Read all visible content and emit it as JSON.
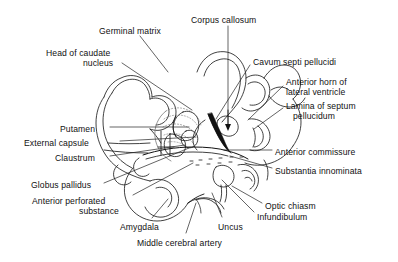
{
  "figure": {
    "type": "anatomical-line-drawing",
    "background_color": "#ffffff",
    "ink_color": "#111111",
    "leader_line_color": "#222222"
  },
  "labels": [
    {
      "id": "germinal-matrix",
      "text": "Germinal matrix",
      "x": 99,
      "y": 26,
      "align": "left"
    },
    {
      "id": "corpus-callosum",
      "text": "Corpus callosum",
      "x": 191,
      "y": 15,
      "align": "left"
    },
    {
      "id": "head-of-caudate-nucleus-1",
      "text": "Head of caudate",
      "x": 46,
      "y": 48,
      "align": "left"
    },
    {
      "id": "head-of-caudate-nucleus-2",
      "text": "nucleus",
      "x": 83,
      "y": 58,
      "align": "left"
    },
    {
      "id": "cavum-septi-pellucidi",
      "text": "Cavum septi pellucidi",
      "x": 253,
      "y": 57,
      "align": "left"
    },
    {
      "id": "anterior-horn-1",
      "text": "Anterior horn of",
      "x": 286,
      "y": 77,
      "align": "left"
    },
    {
      "id": "anterior-horn-2",
      "text": "lateral ventricle",
      "x": 286,
      "y": 87,
      "align": "left"
    },
    {
      "id": "lamina-septum-1",
      "text": "Lamina of septum",
      "x": 286,
      "y": 101,
      "align": "left"
    },
    {
      "id": "lamina-septum-2",
      "text": "pellucidum",
      "x": 293,
      "y": 111,
      "align": "left"
    },
    {
      "id": "putamen",
      "text": "Putamen",
      "x": 60,
      "y": 124,
      "align": "left"
    },
    {
      "id": "external-capsule",
      "text": "External capsule",
      "x": 24,
      "y": 138,
      "align": "left"
    },
    {
      "id": "claustrum",
      "text": "Claustrum",
      "x": 55,
      "y": 153,
      "align": "left"
    },
    {
      "id": "anterior-commissure",
      "text": "Anterior commissure",
      "x": 275,
      "y": 147,
      "align": "left"
    },
    {
      "id": "substantia-innominata",
      "text": "Substantia innominata",
      "x": 275,
      "y": 166,
      "align": "left"
    },
    {
      "id": "globus-pallidus",
      "text": "Globus pallidus",
      "x": 31,
      "y": 180,
      "align": "left"
    },
    {
      "id": "anterior-perforated-1",
      "text": "Anterior perforated",
      "x": 32,
      "y": 196,
      "align": "left"
    },
    {
      "id": "anterior-perforated-2",
      "text": "substance",
      "x": 79,
      "y": 206,
      "align": "left"
    },
    {
      "id": "optic-chiasm",
      "text": "Optic chiasm",
      "x": 265,
      "y": 201,
      "align": "left"
    },
    {
      "id": "infundibulum",
      "text": "Infundibulum",
      "x": 257,
      "y": 212,
      "align": "left"
    },
    {
      "id": "amygdala",
      "text": "Amygdala",
      "x": 120,
      "y": 222,
      "align": "left"
    },
    {
      "id": "uncus",
      "text": "Uncus",
      "x": 218,
      "y": 222,
      "align": "left"
    },
    {
      "id": "middle-cerebral-artery",
      "text": "Middle cerebral artery",
      "x": 137,
      "y": 238,
      "align": "left"
    }
  ],
  "leaders": [
    {
      "id": "leader-germinal-matrix",
      "points": "140,36 168,72"
    },
    {
      "id": "leader-corpus-callosum",
      "points": "228,26 228,127"
    },
    {
      "id": "leader-head-of-caudate",
      "points": "122,63 192,110"
    },
    {
      "id": "leader-cavum-septi",
      "points": "250,65 216,119"
    },
    {
      "id": "leader-anterior-horn",
      "points": "283,86 248,120"
    },
    {
      "id": "leader-lamina-septum",
      "points": "283,108 254,129"
    },
    {
      "id": "leader-putamen",
      "points": "110,127 189,127"
    },
    {
      "id": "leader-external-capsule",
      "points": "120,141 196,137"
    },
    {
      "id": "leader-claustrum",
      "points": "110,156 185,145"
    },
    {
      "id": "leader-anterior-commissure",
      "points": "272,150 224,150"
    },
    {
      "id": "leader-substantia-innominata",
      "points": "272,168 230,156"
    },
    {
      "id": "leader-globus-pallidus",
      "points": "104,183 189,148"
    },
    {
      "id": "leader-anterior-perforated",
      "points": "133,195 193,163"
    },
    {
      "id": "leader-optic-chiasm",
      "points": "262,203 232,186"
    },
    {
      "id": "leader-infundibulum",
      "points": "254,212 222,180"
    },
    {
      "id": "leader-amygdala",
      "points": "152,218 168,199"
    },
    {
      "id": "leader-uncus",
      "points": "222,217 212,193"
    },
    {
      "id": "leader-middle-cerebral-artery",
      "points": "186,233 196,203"
    }
  ]
}
